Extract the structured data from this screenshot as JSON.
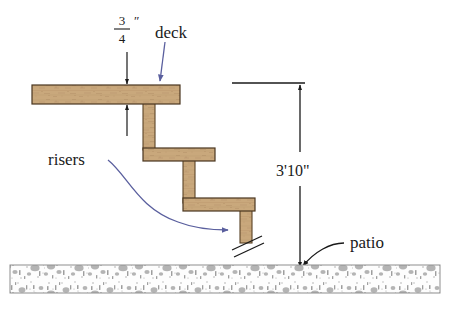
{
  "figure": {
    "background_color": "#ffffff"
  },
  "labels": {
    "deck": "deck",
    "risers": "risers",
    "patio": "patio",
    "height_dimension": "3'10\"",
    "thickness_numerator": "3",
    "thickness_denominator": "4",
    "thickness_unit": "″"
  },
  "colors": {
    "wood_fill": "#c9a87c",
    "wood_edge": "#5a4326",
    "wood_shadow": "#a98a60",
    "concrete_fill": "#fdfdfd",
    "concrete_speckle": "#a8a8a8",
    "concrete_edge": "#8d8d8d",
    "leader_blue": "#5a5f9e",
    "leader_black": "#1a1a1a",
    "dimension_line": "#1a1a1a"
  },
  "geometry": {
    "deck_board": {
      "x": 32,
      "y": 85,
      "width": 148,
      "height": 19
    },
    "tread_middle": {
      "x": 143,
      "y": 148,
      "width": 72,
      "height": 13
    },
    "tread_lower": {
      "x": 183,
      "y": 198,
      "width": 72,
      "height": 13
    },
    "riser_upper": {
      "x": 143,
      "y": 104,
      "width": 12,
      "height": 45
    },
    "riser_middle": {
      "x": 183,
      "y": 160,
      "width": 12,
      "height": 39
    },
    "riser_lower": {
      "x": 240,
      "y": 210,
      "width": 12,
      "height": 31
    },
    "concrete_band": {
      "x": 10,
      "y": 265,
      "width": 430,
      "height": 28
    },
    "dimension_x": 300,
    "dimension_top_y": 83,
    "dimension_bottom_y": 267,
    "reference_line": {
      "x1": 232,
      "x2": 305,
      "y": 83
    }
  }
}
